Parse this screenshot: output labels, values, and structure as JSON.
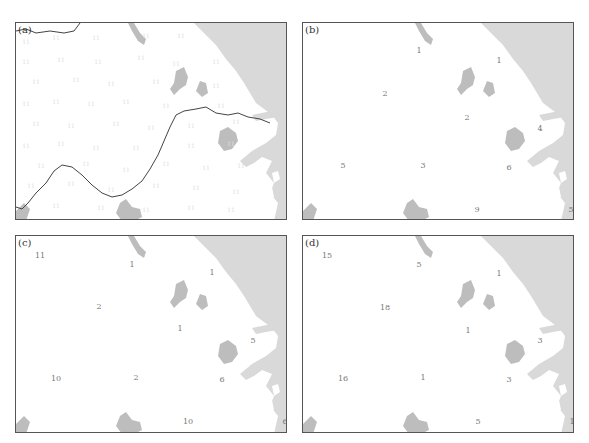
{
  "colors": {
    "sea": "#d9d9d9",
    "lake": "#bdbdbd",
    "land": "#ffffff",
    "frame": "#555555",
    "river": "#444444",
    "label_text": "#777777"
  },
  "panels": [
    {
      "label": "(a)",
      "has_river": true,
      "values": [
        {
          "t": "11",
          "x": 10,
          "y": 18,
          "f": true
        },
        {
          "t": "11",
          "x": 40,
          "y": 14,
          "f": true
        },
        {
          "t": "11",
          "x": 80,
          "y": 14,
          "f": true
        },
        {
          "t": "11",
          "x": 130,
          "y": 12,
          "f": true
        },
        {
          "t": "11",
          "x": 165,
          "y": 12,
          "f": true
        },
        {
          "t": "11",
          "x": 10,
          "y": 38,
          "f": true
        },
        {
          "t": "11",
          "x": 45,
          "y": 36,
          "f": true
        },
        {
          "t": "11",
          "x": 82,
          "y": 38,
          "f": true
        },
        {
          "t": "11",
          "x": 125,
          "y": 34,
          "f": true
        },
        {
          "t": "11",
          "x": 160,
          "y": 40,
          "f": true
        },
        {
          "t": "11",
          "x": 200,
          "y": 38,
          "f": true
        },
        {
          "t": "11",
          "x": 20,
          "y": 58,
          "f": true
        },
        {
          "t": "11",
          "x": 60,
          "y": 56,
          "f": true
        },
        {
          "t": "11",
          "x": 95,
          "y": 60,
          "f": true
        },
        {
          "t": "11",
          "x": 140,
          "y": 58,
          "f": true
        },
        {
          "t": "11",
          "x": 200,
          "y": 62,
          "f": true
        },
        {
          "t": "11",
          "x": 10,
          "y": 80,
          "f": true
        },
        {
          "t": "11",
          "x": 40,
          "y": 78,
          "f": true
        },
        {
          "t": "11",
          "x": 75,
          "y": 80,
          "f": true
        },
        {
          "t": "11",
          "x": 110,
          "y": 78,
          "f": true
        },
        {
          "t": "11",
          "x": 150,
          "y": 82,
          "f": true
        },
        {
          "t": "11",
          "x": 205,
          "y": 82,
          "f": true
        },
        {
          "t": "11",
          "x": 20,
          "y": 100,
          "f": true
        },
        {
          "t": "11",
          "x": 55,
          "y": 102,
          "f": true
        },
        {
          "t": "11",
          "x": 100,
          "y": 100,
          "f": true
        },
        {
          "t": "11",
          "x": 135,
          "y": 104,
          "f": true
        },
        {
          "t": "11",
          "x": 175,
          "y": 102,
          "f": true
        },
        {
          "t": "11",
          "x": 220,
          "y": 98,
          "f": true
        },
        {
          "t": "11",
          "x": 10,
          "y": 122,
          "f": true
        },
        {
          "t": "11",
          "x": 45,
          "y": 120,
          "f": true
        },
        {
          "t": "11",
          "x": 80,
          "y": 124,
          "f": true
        },
        {
          "t": "11",
          "x": 120,
          "y": 124,
          "f": true
        },
        {
          "t": "11",
          "x": 175,
          "y": 122,
          "f": true
        },
        {
          "t": "11",
          "x": 215,
          "y": 120,
          "f": true
        },
        {
          "t": "11",
          "x": 25,
          "y": 142,
          "f": true
        },
        {
          "t": "11",
          "x": 70,
          "y": 140,
          "f": true
        },
        {
          "t": "11",
          "x": 110,
          "y": 146,
          "f": true
        },
        {
          "t": "11",
          "x": 150,
          "y": 140,
          "f": true
        },
        {
          "t": "11",
          "x": 190,
          "y": 144,
          "f": true
        },
        {
          "t": "11",
          "x": 225,
          "y": 142,
          "f": true
        },
        {
          "t": "11",
          "x": 15,
          "y": 162,
          "f": true
        },
        {
          "t": "11",
          "x": 55,
          "y": 160,
          "f": true
        },
        {
          "t": "11",
          "x": 95,
          "y": 166,
          "f": true
        },
        {
          "t": "11",
          "x": 140,
          "y": 162,
          "f": true
        },
        {
          "t": "11",
          "x": 180,
          "y": 164,
          "f": true
        },
        {
          "t": "11",
          "x": 220,
          "y": 168,
          "f": true
        },
        {
          "t": "11",
          "x": 40,
          "y": 182,
          "f": true
        },
        {
          "t": "11",
          "x": 85,
          "y": 184,
          "f": true
        },
        {
          "t": "11",
          "x": 130,
          "y": 186,
          "f": true
        },
        {
          "t": "11",
          "x": 175,
          "y": 184,
          "f": true
        },
        {
          "t": "11",
          "x": 215,
          "y": 186,
          "f": true
        }
      ]
    },
    {
      "label": "(b)",
      "has_river": false,
      "values": [
        {
          "t": "1",
          "x": 116,
          "y": 27
        },
        {
          "t": "1",
          "x": 196,
          "y": 37
        },
        {
          "t": "2",
          "x": 82,
          "y": 70
        },
        {
          "t": "2",
          "x": 164,
          "y": 94
        },
        {
          "t": "4",
          "x": 237,
          "y": 105
        },
        {
          "t": "5",
          "x": 40,
          "y": 142
        },
        {
          "t": "3",
          "x": 120,
          "y": 142
        },
        {
          "t": "6",
          "x": 206,
          "y": 144
        },
        {
          "t": "9",
          "x": 174,
          "y": 186
        },
        {
          "t": "5",
          "x": 268,
          "y": 186
        }
      ]
    },
    {
      "label": "(c)",
      "has_river": false,
      "values": [
        {
          "t": "11",
          "x": 24,
          "y": 19
        },
        {
          "t": "1",
          "x": 116,
          "y": 28
        },
        {
          "t": "1",
          "x": 196,
          "y": 36
        },
        {
          "t": "2",
          "x": 83,
          "y": 70
        },
        {
          "t": "1",
          "x": 164,
          "y": 92
        },
        {
          "t": "5",
          "x": 237,
          "y": 104
        },
        {
          "t": "10",
          "x": 40,
          "y": 142
        },
        {
          "t": "2",
          "x": 120,
          "y": 141
        },
        {
          "t": "6",
          "x": 206,
          "y": 143
        },
        {
          "t": "10",
          "x": 172,
          "y": 185
        },
        {
          "t": "6",
          "x": 269,
          "y": 185
        }
      ]
    },
    {
      "label": "(d)",
      "has_river": false,
      "values": [
        {
          "t": "15",
          "x": 24,
          "y": 19
        },
        {
          "t": "5",
          "x": 116,
          "y": 28
        },
        {
          "t": "1",
          "x": 196,
          "y": 37
        },
        {
          "t": "18",
          "x": 82,
          "y": 71
        },
        {
          "t": "1",
          "x": 165,
          "y": 94
        },
        {
          "t": "3",
          "x": 237,
          "y": 104
        },
        {
          "t": "16",
          "x": 40,
          "y": 142
        },
        {
          "t": "1",
          "x": 120,
          "y": 141
        },
        {
          "t": "3",
          "x": 206,
          "y": 143
        },
        {
          "t": "5",
          "x": 175,
          "y": 185
        },
        {
          "t": "1",
          "x": 269,
          "y": 185
        }
      ]
    }
  ]
}
